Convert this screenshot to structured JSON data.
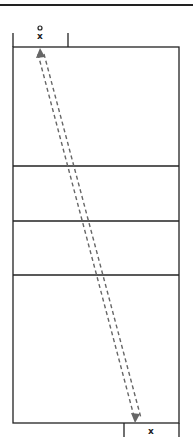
{
  "diagram": {
    "type": "volleyball-court-drill",
    "colors": {
      "line": "#222222",
      "path": "#666666",
      "background": "#ffffff"
    },
    "markers": {
      "top_player": {
        "symbol": "x",
        "has_ball": true,
        "ball_symbol": "o"
      },
      "bottom_player": {
        "symbol": "x"
      }
    },
    "paths": [
      {
        "style": "dashed",
        "direction": "bidirectional",
        "from": "bottom-right",
        "to": "top-left"
      }
    ]
  }
}
